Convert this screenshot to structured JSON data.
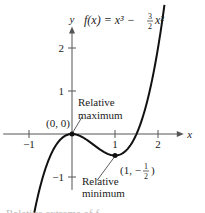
{
  "chart_data": {
    "type": "line",
    "function": "x^3 - 1.5*x^2",
    "xlabel": "x",
    "ylabel": "y",
    "xlim": [
      -1.6,
      2.6
    ],
    "ylim": [
      -1.3,
      2.5
    ],
    "xticks": [
      -1,
      1,
      2
    ],
    "xtick_labels": [
      "−1",
      "1",
      "2"
    ],
    "yticks": [
      -1,
      1,
      2
    ],
    "ytick_labels": [
      "−1",
      "1",
      "2"
    ],
    "grid": false,
    "series": [
      {
        "name": "f(x)",
        "x_range": [
          -1.0,
          2.15
        ]
      }
    ],
    "points": [
      {
        "x": 0,
        "y": 0,
        "label": "(0, 0)",
        "annotation": [
          "Relative",
          "maximum"
        ]
      },
      {
        "x": 1,
        "y": -0.5,
        "label": "(1, −1/2)",
        "annotation": [
          "Relative",
          "minimum"
        ]
      }
    ]
  },
  "footer_text": "Relative extrema of f"
}
